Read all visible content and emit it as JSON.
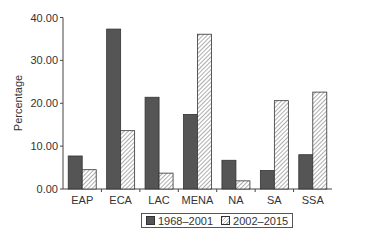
{
  "chart_data": {
    "type": "bar",
    "title": "",
    "xlabel": "",
    "ylabel": "Percentage",
    "ylim": [
      0,
      40
    ],
    "yticks": [
      "0.00",
      "10.00",
      "20.00",
      "30.00",
      "40.00"
    ],
    "grid": false,
    "legend_position": "bottom",
    "categories": [
      "EAP",
      "ECA",
      "LAC",
      "MENA",
      "NA",
      "SA",
      "SSA"
    ],
    "series": [
      {
        "name": "1968–2001",
        "style": "solid-dark",
        "color": "#555555",
        "values": [
          7.7,
          37.3,
          21.4,
          17.4,
          6.7,
          4.3,
          8.0
        ]
      },
      {
        "name": "2002–2015",
        "style": "hatched",
        "color": "#bbbbbb",
        "values": [
          4.5,
          13.6,
          3.7,
          36.1,
          1.9,
          20.6,
          22.6
        ]
      }
    ]
  },
  "legend": {
    "items": [
      "1968–2001",
      "2002–2015"
    ]
  }
}
